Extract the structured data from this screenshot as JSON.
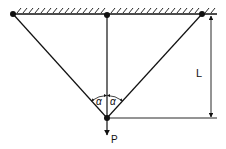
{
  "diagram": {
    "type": "three-bar truss with hanging load",
    "colors": {
      "line": "#111111",
      "background": "#ffffff"
    },
    "labels": {
      "angle_left": "α",
      "angle_right": "α",
      "length": "L",
      "load": "P"
    },
    "elements": {
      "ceiling": "fixed support (hatched)",
      "supports": [
        "left-pin",
        "center-pin",
        "right-pin"
      ],
      "bars": [
        "left-inclined-bar",
        "vertical-bar",
        "right-inclined-bar"
      ],
      "joint": "bottom-node",
      "load_arrow": "downward force P",
      "dimension": "vertical length L"
    }
  }
}
